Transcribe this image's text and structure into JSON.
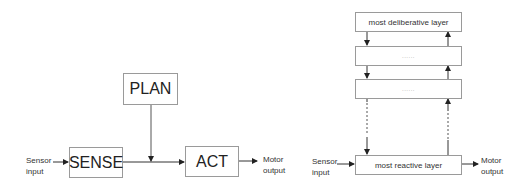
{
  "left_diagram": {
    "plan_label": "PLAN",
    "sense_label": "SENSE",
    "act_label": "ACT",
    "input_label_line1": "Sensor",
    "input_label_line2": "input",
    "output_label_line1": "Motor",
    "output_label_line2": "output"
  },
  "right_diagram": {
    "layers": [
      {
        "label": "most deliberative layer"
      },
      {
        "label": "......"
      },
      {
        "label": "......"
      },
      {
        "label": "most reactive layer"
      }
    ],
    "input_label_line1": "Sensor",
    "input_label_line2": "input",
    "output_label_line1": "Motor",
    "output_label_line2": "output"
  },
  "colors": {
    "line": "#333333",
    "box_border": "#9a9a9a"
  }
}
